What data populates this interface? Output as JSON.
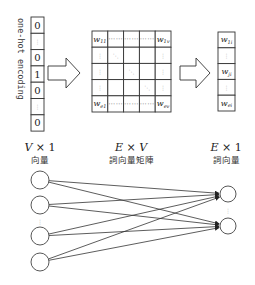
{
  "diagram": {
    "onehot": {
      "label": "one-hot encoding",
      "cells": [
        "0",
        "⋮",
        "0",
        "1",
        "0",
        "⋮",
        "0"
      ]
    },
    "matrix": {
      "rows": [
        [
          {
            "t": "w",
            "s": "11"
          },
          {
            "t": "…"
          },
          {
            "t": "…"
          },
          {
            "t": "…"
          },
          {
            "t": "w",
            "s": "1v"
          }
        ],
        [
          {
            "t": "⋮"
          },
          {
            "t": "⋱"
          },
          {
            "t": ""
          },
          {
            "t": ""
          },
          {
            "t": "⋮"
          }
        ],
        [
          {
            "t": "⋮"
          },
          {
            "t": ""
          },
          {
            "t": "⋱"
          },
          {
            "t": ""
          },
          {
            "t": "⋮"
          }
        ],
        [
          {
            "t": "⋮"
          },
          {
            "t": ""
          },
          {
            "t": ""
          },
          {
            "t": "⋱"
          },
          {
            "t": "⋮"
          }
        ],
        [
          {
            "t": "w",
            "s": "e1"
          },
          {
            "t": "…"
          },
          {
            "t": "…"
          },
          {
            "t": "…"
          },
          {
            "t": "w",
            "s": "ev"
          }
        ]
      ]
    },
    "output_vector": {
      "cells": [
        {
          "t": "w",
          "s": "1i"
        },
        {
          "t": "⋮"
        },
        {
          "t": "w",
          "s": "ji"
        },
        {
          "t": "⋮"
        },
        {
          "t": "w",
          "s": "ei"
        }
      ]
    },
    "captions": [
      {
        "dim_a": "V",
        "times": " × ",
        "dim_b": "1",
        "dim_b_italic": false,
        "label": "向量"
      },
      {
        "dim_a": "E",
        "times": " × ",
        "dim_b": "V",
        "dim_b_italic": true,
        "label": "詞向量矩陣"
      },
      {
        "dim_a": "E",
        "times": " × ",
        "dim_b": "1",
        "dim_b_italic": false,
        "label": "詞向量"
      }
    ],
    "network": {
      "input_nodes": 4,
      "output_nodes": 2,
      "input_ellipsis": "⋮",
      "output_ellipsis": "⋮"
    }
  }
}
